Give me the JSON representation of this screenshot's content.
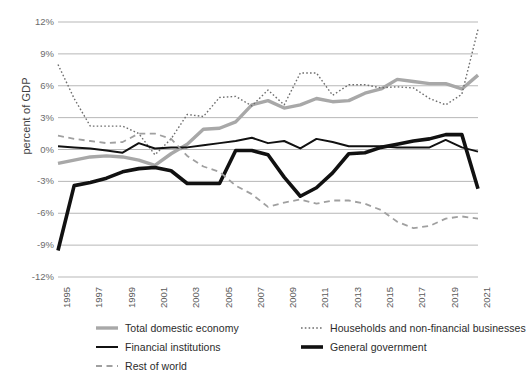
{
  "chart_data": {
    "type": "line",
    "title": "",
    "xlabel": "",
    "ylabel": "percent of GDP",
    "ylim": [
      -12,
      12
    ],
    "ytick_values": [
      12,
      9,
      6,
      3,
      0,
      -3,
      -6,
      -9,
      -12
    ],
    "ytick_labels": [
      "12%",
      "9%",
      "6%",
      "3%",
      "0%",
      "-3%",
      "-6%",
      "-9%",
      "-12%"
    ],
    "grid": true,
    "legend_position": "bottom",
    "x": [
      1995,
      1996,
      1997,
      1998,
      1999,
      2000,
      2001,
      2002,
      2003,
      2004,
      2005,
      2006,
      2007,
      2008,
      2009,
      2010,
      2011,
      2012,
      2013,
      2014,
      2015,
      2016,
      2017,
      2018,
      2019,
      2020,
      2021
    ],
    "xtick_values": [
      1995,
      1997,
      1999,
      2001,
      2003,
      2005,
      2007,
      2009,
      2011,
      2013,
      2015,
      2017,
      2019,
      2021
    ],
    "xtick_labels": [
      "1995",
      "1997",
      "1999",
      "2001",
      "2003",
      "2005",
      "2007",
      "2009",
      "2011",
      "2013",
      "2015",
      "2017",
      "2019",
      "2021"
    ],
    "series": [
      {
        "name": "Total domestic economy",
        "color": "#a8a8a8",
        "style": "solid",
        "width": 3.4,
        "values": [
          -1.3,
          -1.0,
          -0.7,
          -0.6,
          -0.7,
          -1.0,
          -1.5,
          -0.4,
          0.5,
          1.9,
          2.0,
          2.6,
          4.2,
          4.6,
          3.9,
          4.2,
          4.8,
          4.5,
          4.6,
          5.3,
          5.7,
          6.6,
          6.4,
          6.2,
          6.2,
          5.7,
          7.0
        ]
      },
      {
        "name": "Households and non-financial businesses",
        "color": "#6e6e6e",
        "style": "dotted",
        "width": 1.4,
        "values": [
          8.0,
          4.8,
          2.2,
          2.2,
          2.2,
          1.5,
          -0.5,
          1.0,
          3.3,
          3.1,
          4.9,
          5.0,
          4.1,
          5.6,
          4.2,
          7.2,
          7.2,
          5.1,
          6.1,
          6.1,
          5.8,
          5.9,
          5.8,
          4.8,
          4.2,
          5.2,
          11.3
        ]
      },
      {
        "name": "Financial institutions",
        "color": "#111111",
        "style": "solid",
        "width": 2.0,
        "values": [
          0.3,
          0.2,
          0.1,
          -0.1,
          -0.3,
          0.6,
          0.1,
          0.2,
          0.2,
          0.4,
          0.6,
          0.8,
          1.1,
          0.6,
          0.8,
          0.1,
          1.0,
          0.7,
          0.3,
          0.3,
          0.3,
          0.2,
          0.2,
          0.2,
          0.9,
          0.2,
          -0.2
        ]
      },
      {
        "name": "General government",
        "color": "#111111",
        "style": "solid",
        "width": 3.6,
        "values": [
          -9.5,
          -3.4,
          -3.1,
          -2.7,
          -2.1,
          -1.8,
          -1.7,
          -2.0,
          -3.2,
          -3.2,
          -3.2,
          -0.1,
          -0.1,
          -0.5,
          -2.6,
          -4.4,
          -3.6,
          -2.2,
          -0.4,
          -0.3,
          0.2,
          0.5,
          0.8,
          1.0,
          1.4,
          1.4,
          -3.7
        ]
      },
      {
        "name": "Rest of world",
        "color": "#a0a0a0",
        "style": "dashed",
        "width": 1.8,
        "values": [
          1.3,
          1.0,
          0.8,
          0.6,
          0.7,
          1.5,
          1.5,
          1.0,
          -0.6,
          -1.6,
          -2.1,
          -3.4,
          -4.2,
          -5.4,
          -5.0,
          -4.7,
          -5.1,
          -4.8,
          -4.8,
          -5.1,
          -5.7,
          -6.8,
          -7.4,
          -7.2,
          -6.5,
          -6.3,
          -6.5
        ]
      }
    ]
  },
  "legend": {
    "items": [
      {
        "label": "Total domestic economy"
      },
      {
        "label": "Households and non-financial businesses"
      },
      {
        "label": "Financial institutions"
      },
      {
        "label": "General government"
      },
      {
        "label": "Rest of world"
      }
    ]
  }
}
